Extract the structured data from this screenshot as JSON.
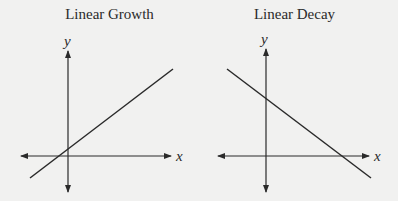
{
  "panels": [
    {
      "title": "Linear Growth",
      "x_label": "x",
      "y_label": "y",
      "line": {
        "x1": 30,
        "y1": 178,
        "x2": 173,
        "y2": 69
      },
      "axes": {
        "origin_x": 68,
        "origin_y": 156
      }
    },
    {
      "title": "Linear Decay",
      "x_label": "x",
      "y_label": "y",
      "line": {
        "x1": 28,
        "y1": 69,
        "x2": 172,
        "y2": 178
      },
      "axes": {
        "origin_x": 67,
        "origin_y": 156
      }
    }
  ],
  "colors": {
    "background": "#f1f1f0",
    "ink": "#2a2a2a"
  }
}
